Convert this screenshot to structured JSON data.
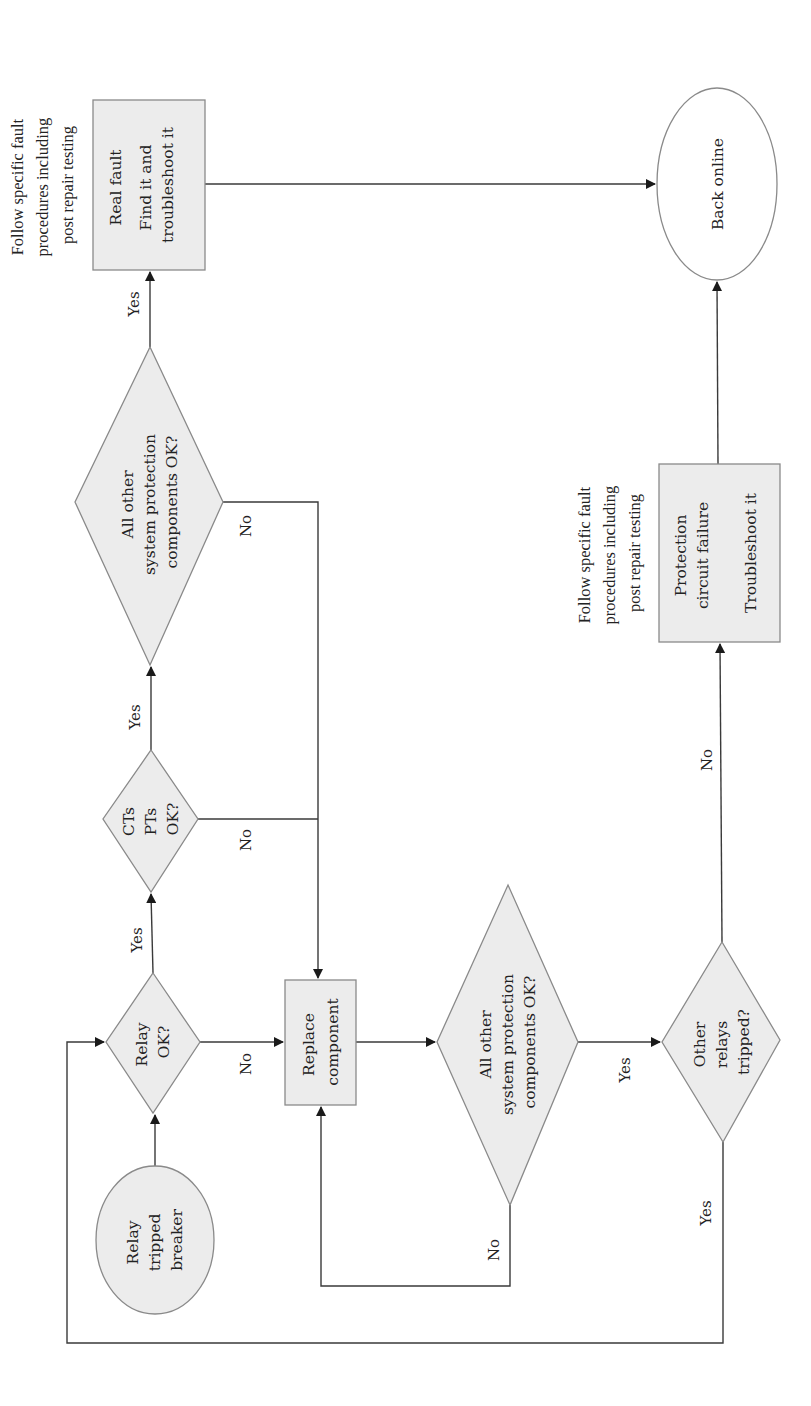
{
  "diagram": {
    "orientation": "rotated-90-ccw",
    "fill_color": "#ececec",
    "stroke_color": "#8a8a8a",
    "edge_color": "#3a3a3a",
    "nodes": {
      "start": {
        "lines": [
          "Relay",
          "tripped",
          "breaker"
        ]
      },
      "relay_ok": {
        "lines": [
          "Relay",
          "OK?"
        ]
      },
      "cts_pts_ok": {
        "lines": [
          "CTs",
          "PTs",
          "OK?"
        ]
      },
      "all_other_1": {
        "lines": [
          "All other",
          "system protection",
          "components OK?"
        ]
      },
      "real_fault": {
        "lines": [
          "Real fault",
          "",
          "Find it and",
          "troubleshoot it"
        ]
      },
      "replace_component": {
        "lines": [
          "Replace",
          "component"
        ]
      },
      "all_other_2": {
        "lines": [
          "All other",
          "system protection",
          "components OK?"
        ]
      },
      "other_relays": {
        "lines": [
          "Other",
          "relays",
          "tripped?"
        ]
      },
      "protection_failure": {
        "lines": [
          "Protection",
          "circuit failure",
          "",
          "Troubleshoot it"
        ]
      },
      "back_online": {
        "lines": [
          "Back online"
        ]
      }
    },
    "notes": {
      "real_fault_note": [
        "Follow specific fault",
        "procedures including",
        "post repair testing"
      ],
      "protection_note": [
        "Follow specific fault",
        "procedures including",
        "post repair testing"
      ]
    },
    "edge_labels": {
      "relay_ok_yes": "Yes",
      "relay_ok_no": "No",
      "cts_yes": "Yes",
      "cts_no": "No",
      "all1_yes": "Yes",
      "all1_no": "No",
      "all2_yes": "Yes",
      "all2_no": "No",
      "other_no": "No",
      "other_yes": "Yes"
    }
  }
}
